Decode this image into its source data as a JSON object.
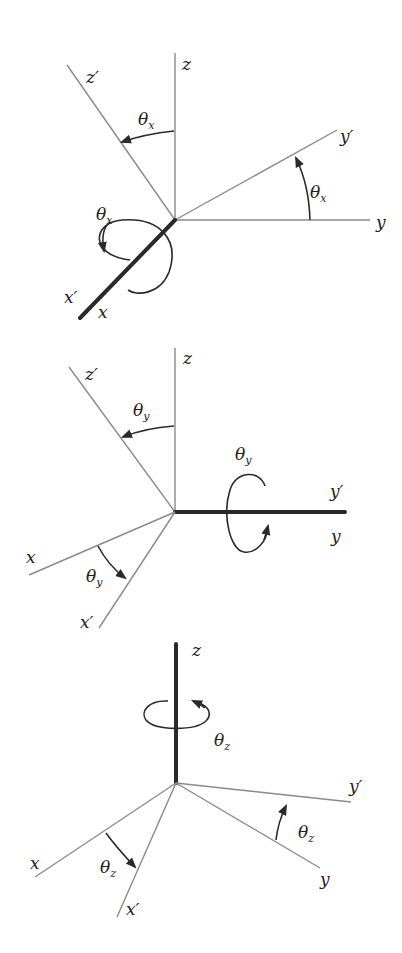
{
  "colors": {
    "thin_axis": "#8a8a8a",
    "bold_axis": "#2a2a2a",
    "background": "#ffffff"
  },
  "panels": [
    {
      "name": "rotation-about-x",
      "rotation_axis": "x",
      "theta": "θ",
      "sub": "x",
      "labels": {
        "z": "z",
        "zp": "z′",
        "y": "y",
        "yp": "y′",
        "x": "x",
        "xp": "x′"
      }
    },
    {
      "name": "rotation-about-y",
      "rotation_axis": "y",
      "theta": "θ",
      "sub": "y",
      "labels": {
        "z": "z",
        "zp": "z′",
        "y": "y",
        "yp": "y′",
        "x": "x",
        "xp": "x′"
      }
    },
    {
      "name": "rotation-about-z",
      "rotation_axis": "z",
      "theta": "θ",
      "sub": "z",
      "labels": {
        "z": "z",
        "y": "y",
        "yp": "y′",
        "x": "x",
        "xp": "x′"
      }
    }
  ]
}
